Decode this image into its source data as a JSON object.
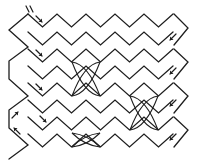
{
  "diagram": {
    "width": 206,
    "height": 160,
    "stroke_color": "#1e1e1e",
    "background": "#ffffff",
    "period": 29,
    "zigzag_rows": [
      {
        "id": "row-1",
        "peak_y": 14,
        "valley_y": 27,
        "start_x": 28,
        "start_phase": "peak"
      },
      {
        "id": "row-2",
        "peak_y": 32,
        "valley_y": 45,
        "start_x": 28,
        "start_phase": "peak"
      },
      {
        "id": "row-3",
        "peak_y": 49,
        "valley_y": 62,
        "start_x": 28,
        "start_phase": "peak"
      },
      {
        "id": "row-4",
        "peak_y": 66,
        "valley_y": 79,
        "start_x": 28,
        "start_phase": "peak"
      },
      {
        "id": "row-5",
        "peak_y": 83,
        "valley_y": 96,
        "start_x": 28,
        "start_phase": "peak"
      },
      {
        "id": "row-6",
        "peak_y": 100,
        "valley_y": 113,
        "start_x": 28,
        "start_phase": "peak"
      },
      {
        "id": "row-7",
        "peak_y": 117,
        "valley_y": 130,
        "start_x": 28,
        "start_phase": "peak"
      },
      {
        "id": "row-8",
        "peak_y": 134,
        "valley_y": 147,
        "start_x": 28,
        "start_phase": "peak"
      }
    ],
    "left_edge_tips": [
      {
        "x": 9,
        "y": 30
      },
      {
        "x": 9,
        "y": 79
      },
      {
        "x": 9,
        "y": 128
      }
    ],
    "right_edge_tips": [
      {
        "x": 188,
        "y": 28
      },
      {
        "x": 188,
        "y": 62
      },
      {
        "x": 188,
        "y": 96
      },
      {
        "x": 188,
        "y": 130
      }
    ],
    "arrows": [
      {
        "id": "arrow-1",
        "direction": "down-right",
        "x": 36,
        "y": 16
      },
      {
        "id": "arrow-2",
        "direction": "down-right",
        "x": 36,
        "y": 50
      },
      {
        "id": "arrow-3",
        "direction": "down-right",
        "x": 36,
        "y": 84
      },
      {
        "id": "arrow-4",
        "direction": "down-right",
        "x": 40,
        "y": 116
      },
      {
        "id": "arrow-5",
        "direction": "up-right",
        "x": 12,
        "y": 118
      },
      {
        "id": "arrow-6",
        "direction": "up-left",
        "x": 20,
        "y": 134
      },
      {
        "id": "arrow-7",
        "direction": "down-left",
        "x": 176,
        "y": 34
      },
      {
        "id": "arrow-8",
        "direction": "down-left",
        "x": 176,
        "y": 68
      },
      {
        "id": "arrow-9",
        "direction": "down-left",
        "x": 176,
        "y": 100
      },
      {
        "id": "arrow-10",
        "direction": "down-left",
        "x": 176,
        "y": 134
      }
    ],
    "tick_marks": [
      {
        "id": "start-tick",
        "x": 28,
        "y": 9
      }
    ],
    "lens_crossings": [
      {
        "id": "lens-1",
        "cx": 86,
        "cy": 79,
        "rx": 14,
        "ry": 17
      },
      {
        "id": "lens-2",
        "cx": 86,
        "cy": 140,
        "rx": 14,
        "ry": 7
      },
      {
        "id": "lens-3",
        "cx": 144,
        "cy": 113,
        "rx": 14,
        "ry": 17
      }
    ]
  }
}
